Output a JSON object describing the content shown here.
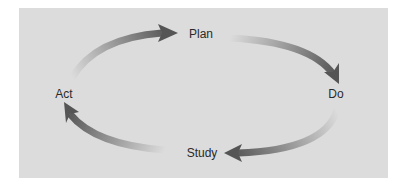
{
  "diagram": {
    "type": "cycle",
    "title": "",
    "stages": [
      {
        "id": "plan",
        "label": "Plan"
      },
      {
        "id": "do",
        "label": "Do"
      },
      {
        "id": "study",
        "label": "Study"
      },
      {
        "id": "act",
        "label": "Act"
      }
    ],
    "edges": [
      {
        "from": "act",
        "to": "plan"
      },
      {
        "from": "plan",
        "to": "do"
      },
      {
        "from": "do",
        "to": "study"
      },
      {
        "from": "study",
        "to": "act"
      }
    ],
    "colors": {
      "panel_background": "#dcdcdc",
      "arrow_dark": "#555555",
      "arrow_light": "#dcdcdc",
      "text": "#2a2a2a"
    }
  }
}
